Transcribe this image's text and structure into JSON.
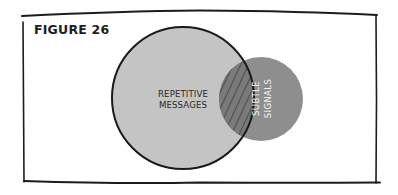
{
  "figure": {
    "title": "FIGURE 26"
  },
  "venn": {
    "sets": [
      {
        "id": "repetitive-messages",
        "label_line1": "REPETITIVE",
        "label_line2": "MESSAGES",
        "fill": "#c4c4c4",
        "outline": "#1a1a1a"
      },
      {
        "id": "subtle-signals",
        "label_line1": "SUBTLE",
        "label_line2": "SIGNALS",
        "fill": "#8e8e8e",
        "label_color": "#f2f2f2"
      }
    ],
    "overlap": {
      "fill": "#7a7a7a",
      "hatch_color": "#4e4e4e",
      "pattern": "diagonal-hatch"
    }
  }
}
